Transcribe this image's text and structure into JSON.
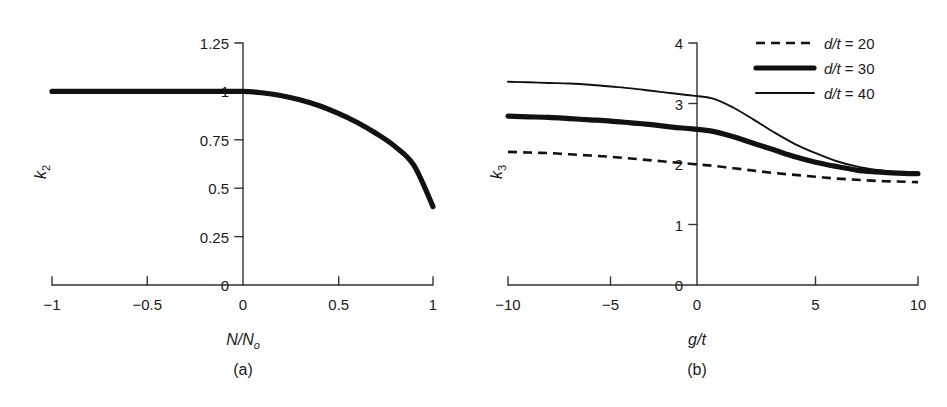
{
  "figure": {
    "panel_a_caption": "(a)",
    "panel_b_caption": "(b)"
  },
  "chart_data": [
    {
      "type": "line",
      "panel": "(a)",
      "title": "",
      "xlabel": "N/No",
      "ylabel": "k2",
      "xlabel_parts": {
        "main": "N/N",
        "sub": "o"
      },
      "ylabel_parts": {
        "main": "k",
        "sub": "2"
      },
      "xlim": [
        -1,
        1
      ],
      "ylim": [
        0,
        1.25
      ],
      "xticks": [
        -1,
        -0.5,
        0,
        0.5,
        1
      ],
      "xtick_labels": [
        "−1",
        "−0.5",
        "0",
        "0.5",
        "1"
      ],
      "yticks": [
        0,
        0.25,
        0.5,
        0.75,
        1,
        1.25
      ],
      "ytick_labels": [
        "0",
        "0.25",
        "0.5",
        "0.75",
        "1",
        "1.25"
      ],
      "grid": false,
      "legend": "none",
      "series": [
        {
          "name": "k2",
          "style": "thick-solid",
          "x": [
            -1.0,
            -0.9,
            -0.8,
            -0.7,
            -0.6,
            -0.5,
            -0.4,
            -0.3,
            -0.2,
            -0.1,
            0.0,
            0.1,
            0.2,
            0.3,
            0.4,
            0.5,
            0.6,
            0.7,
            0.8,
            0.9,
            1.0
          ],
          "values": [
            1.0,
            1.0,
            1.0,
            1.0,
            1.0,
            1.0,
            1.0,
            1.0,
            1.0,
            1.0,
            1.0,
            0.993,
            0.979,
            0.957,
            0.927,
            0.888,
            0.841,
            0.784,
            0.716,
            0.618,
            0.405
          ]
        }
      ]
    },
    {
      "type": "line",
      "panel": "(b)",
      "title": "",
      "xlabel": "g/t",
      "ylabel": "k3",
      "xlabel_parts": {
        "main": "g/t",
        "sub": ""
      },
      "ylabel_parts": {
        "main": "k",
        "sub": "3"
      },
      "xlim": [
        -10,
        10
      ],
      "ylim": [
        0,
        4
      ],
      "xticks": [
        -10,
        -5,
        0,
        5,
        10
      ],
      "xtick_labels": [
        "−10",
        "−5",
        "0",
        "5",
        "10"
      ],
      "yticks": [
        0,
        1,
        2,
        3,
        4
      ],
      "ytick_labels": [
        "0",
        "1",
        "2",
        "3",
        "4"
      ],
      "grid": false,
      "legend": "top-right",
      "series": [
        {
          "name": "d/t = 20",
          "legend_main": "d",
          "legend_rest": "/t",
          "legend_value": "= 20",
          "style": "dashed",
          "x": [
            -10,
            -9,
            -8,
            -7,
            -6,
            -5,
            -4,
            -3,
            -2,
            -1,
            0,
            1,
            2,
            3,
            4,
            5,
            6,
            7,
            8,
            9,
            10
          ],
          "values": [
            2.2,
            2.19,
            2.18,
            2.16,
            2.14,
            2.12,
            2.09,
            2.06,
            2.03,
            2.0,
            1.97,
            1.93,
            1.89,
            1.85,
            1.82,
            1.79,
            1.76,
            1.74,
            1.72,
            1.71,
            1.7
          ]
        },
        {
          "name": "d/t = 30",
          "legend_main": "d",
          "legend_rest": "/t",
          "legend_value": "= 30",
          "style": "thick-solid",
          "x": [
            -10,
            -9,
            -8,
            -7,
            -6,
            -5,
            -4,
            -3,
            -2,
            -1,
            0,
            1,
            2,
            3,
            4,
            5,
            6,
            7,
            8,
            9,
            10
          ],
          "values": [
            2.79,
            2.78,
            2.77,
            2.75,
            2.73,
            2.71,
            2.68,
            2.65,
            2.61,
            2.58,
            2.54,
            2.45,
            2.34,
            2.23,
            2.12,
            2.03,
            1.96,
            1.9,
            1.87,
            1.85,
            1.84
          ]
        },
        {
          "name": "d/t = 40",
          "legend_main": "d",
          "legend_rest": "/t",
          "legend_value": "= 40",
          "style": "thin-solid",
          "x": [
            -10,
            -9,
            -8,
            -7,
            -6,
            -5,
            -4,
            -3,
            -2,
            -1,
            0,
            1,
            2,
            3,
            4,
            5,
            6,
            7,
            8,
            9,
            10
          ],
          "values": [
            3.36,
            3.35,
            3.34,
            3.33,
            3.31,
            3.28,
            3.25,
            3.21,
            3.17,
            3.13,
            3.08,
            2.93,
            2.73,
            2.52,
            2.33,
            2.18,
            2.05,
            1.96,
            1.9,
            1.86,
            1.84
          ]
        }
      ]
    }
  ]
}
